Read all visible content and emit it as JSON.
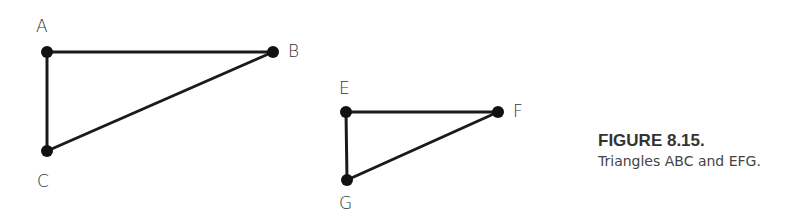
{
  "figure": {
    "title": "FIGURE 8.15.",
    "caption": "Triangles ABC and EFG."
  },
  "triangles": [
    {
      "name": "ABC",
      "vertices": [
        {
          "label": "A",
          "x": 47,
          "y": 52
        },
        {
          "label": "B",
          "x": 273,
          "y": 52
        },
        {
          "label": "C",
          "x": 47,
          "y": 151
        }
      ]
    },
    {
      "name": "EFG",
      "vertices": [
        {
          "label": "E",
          "x": 346,
          "y": 112
        },
        {
          "label": "F",
          "x": 498,
          "y": 112
        },
        {
          "label": "G",
          "x": 347,
          "y": 180
        }
      ]
    }
  ],
  "labels": {
    "A": "A",
    "B": "B",
    "C": "C",
    "E": "E",
    "F": "F",
    "G": "G"
  },
  "colors": {
    "stroke": "#1a1a1a",
    "text": "#333333"
  }
}
